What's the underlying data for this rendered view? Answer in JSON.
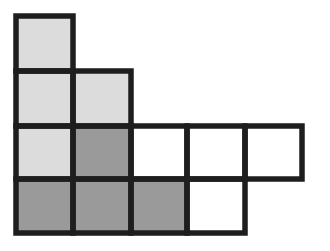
{
  "diagram": {
    "stroke_color": "#1e1e1e",
    "stroke_width": 5.5,
    "colors": {
      "light": "#dcdcdc",
      "dark": "#9a9a9a",
      "white": "#ffffff"
    },
    "column_lines": [
      16,
      73,
      131,
      187,
      245,
      302
    ],
    "row_lines": [
      16,
      71,
      126,
      179,
      233
    ],
    "cells": [
      {
        "row": 0,
        "col": 0,
        "fill": "light"
      },
      {
        "row": 1,
        "col": 0,
        "fill": "light"
      },
      {
        "row": 1,
        "col": 1,
        "fill": "light"
      },
      {
        "row": 2,
        "col": 0,
        "fill": "light"
      },
      {
        "row": 2,
        "col": 1,
        "fill": "dark"
      },
      {
        "row": 2,
        "col": 2,
        "fill": "white"
      },
      {
        "row": 2,
        "col": 3,
        "fill": "white"
      },
      {
        "row": 2,
        "col": 4,
        "fill": "white"
      },
      {
        "row": 3,
        "col": 0,
        "fill": "dark"
      },
      {
        "row": 3,
        "col": 1,
        "fill": "dark"
      },
      {
        "row": 3,
        "col": 2,
        "fill": "dark"
      },
      {
        "row": 3,
        "col": 3,
        "fill": "white"
      }
    ]
  }
}
